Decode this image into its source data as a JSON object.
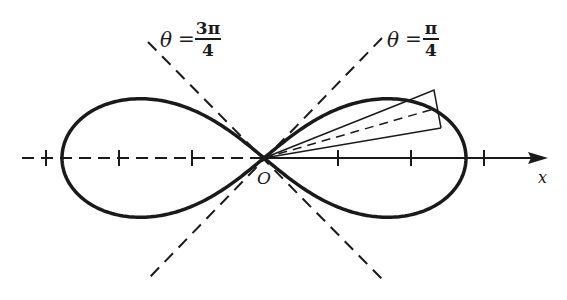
{
  "diagram": {
    "curve": "lemniscate",
    "origin_label": "O",
    "axis_label": "x",
    "asymptote_labels": [
      {
        "theta": "θ",
        "equals": "=",
        "numerator": "3π",
        "denominator": "4"
      },
      {
        "theta": "θ",
        "equals": "=",
        "numerator": "π",
        "denominator": "4"
      }
    ],
    "ticks_right": 3,
    "ticks_left": 3,
    "colors": {
      "ink": "#1a1a1a",
      "background": "#ffffff"
    }
  }
}
